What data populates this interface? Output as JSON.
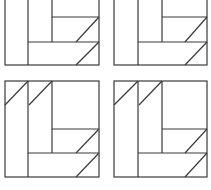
{
  "diagram": {
    "stroke_color": "#3a3a3a",
    "background": "#ffffff",
    "figures": [
      {
        "id": "top-left",
        "rects": [
          [
            5,
            -10,
            94,
            75
          ]
        ],
        "lines": [
          [
            28,
            -10,
            28,
            65
          ],
          [
            52,
            -10,
            52,
            42
          ],
          [
            52,
            17,
            99,
            17
          ],
          [
            28,
            42,
            99,
            42
          ],
          [
            99,
            17,
            76,
            42
          ],
          [
            99,
            42,
            76,
            65
          ]
        ]
      },
      {
        "id": "top-right",
        "rects": [
          [
            114,
            -10,
            93,
            75
          ]
        ],
        "lines": [
          [
            138,
            -10,
            138,
            65
          ],
          [
            162,
            -10,
            162,
            42
          ],
          [
            162,
            17,
            207,
            17
          ],
          [
            138,
            42,
            207,
            42
          ],
          [
            207,
            17,
            185,
            42
          ],
          [
            207,
            42,
            185,
            65
          ]
        ]
      },
      {
        "id": "bottom-left",
        "rects": [
          [
            5,
            81,
            94,
            96
          ]
        ],
        "lines": [
          [
            28,
            81,
            28,
            177
          ],
          [
            52,
            81,
            52,
            153
          ],
          [
            52,
            129,
            99,
            129
          ],
          [
            28,
            153,
            99,
            153
          ],
          [
            28,
            81,
            5,
            105
          ],
          [
            52,
            81,
            29,
            105
          ],
          [
            99,
            129,
            76,
            153
          ],
          [
            99,
            153,
            76,
            177
          ]
        ]
      },
      {
        "id": "bottom-right",
        "rects": [
          [
            114,
            81,
            93,
            96
          ]
        ],
        "lines": [
          [
            138,
            81,
            138,
            177
          ],
          [
            162,
            81,
            162,
            153
          ],
          [
            162,
            129,
            207,
            129
          ],
          [
            138,
            153,
            207,
            153
          ],
          [
            138,
            81,
            114,
            105
          ],
          [
            162,
            81,
            139,
            105
          ],
          [
            207,
            129,
            185,
            153
          ],
          [
            207,
            153,
            185,
            177
          ]
        ]
      }
    ]
  }
}
